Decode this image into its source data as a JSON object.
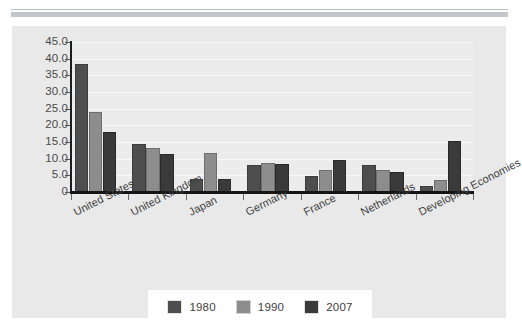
{
  "chart_data": {
    "type": "bar",
    "title": "",
    "subtitle": "",
    "xlabel": "",
    "ylabel": "",
    "ylim": [
      0,
      45
    ],
    "ytick_step": 5,
    "ytick_labels": [
      "45.0",
      "40.0",
      "35.0",
      "30.0",
      "25.0",
      "20.0",
      "15.0",
      "10.0",
      "5.0",
      "0"
    ],
    "ytick_values": [
      45,
      40,
      35,
      30,
      25,
      20,
      15,
      10,
      5,
      0
    ],
    "grid": true,
    "grid_axis": "y",
    "legend_position": "bottom",
    "categories": [
      "United States",
      "United Kingdom",
      "Japan",
      "Germany",
      "France",
      "Netherlands",
      "Developing Economies"
    ],
    "series": [
      {
        "name": "1980",
        "color": "#4e4e4e",
        "values": [
          38.5,
          14.5,
          3.9,
          8.0,
          4.7,
          8.0,
          1.7
        ]
      },
      {
        "name": "1990",
        "color": "#8d8d8d",
        "values": [
          24.1,
          13.1,
          11.6,
          8.7,
          6.7,
          6.7,
          3.5
        ]
      },
      {
        "name": "2007",
        "color": "#3a3a3a",
        "values": [
          18.1,
          11.4,
          3.9,
          8.3,
          9.5,
          6.0,
          15.4
        ]
      }
    ]
  },
  "legend": {
    "entries": [
      {
        "label": "1980"
      },
      {
        "label": "1990"
      },
      {
        "label": "2007"
      }
    ]
  },
  "colors": {
    "panel_background": "#e9e9e9",
    "plot_background": "#ececec",
    "gridline": "#f8f8f8",
    "axis": "#141414",
    "series_1980": "#4e4e4e",
    "series_1990": "#8d8d8d",
    "series_2007": "#3a3a3a",
    "page_background": "#ffffff",
    "rule": "#c3c6ca"
  }
}
